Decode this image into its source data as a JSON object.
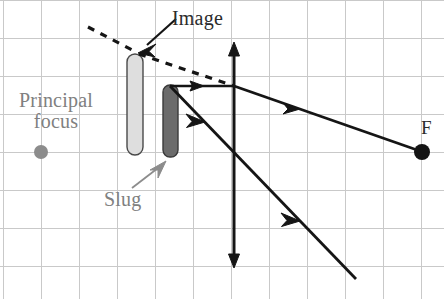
{
  "figure": {
    "type": "ray-diagram",
    "background_color": "#ffffff",
    "grid": {
      "visible": true,
      "color": "#c9c9c9",
      "spacing_px": 38,
      "x_origin_px": 41,
      "y_origin_px": 38,
      "line_width_px": 1
    }
  },
  "labels": {
    "principal_focus": "Principal\nfocus",
    "principal_focus_line1": "Principal",
    "principal_focus_line2": "focus",
    "slug": "Slug",
    "image": "Image",
    "focus_point": "F"
  },
  "colors": {
    "grid": "#c9c9c9",
    "label_gray": "#808080",
    "label_dark": "#2b2b2b",
    "ray_solid": "#1a1a1a",
    "ray_dashed": "#1a1a1a",
    "image_object_fill": "#dcdcdc",
    "image_object_stroke": "#555555",
    "slug_object_fill": "#6e6e6e",
    "slug_object_stroke": "#3d3d3d",
    "principal_focus_dot": "#8c8c8c",
    "focus_dot": "#111111"
  },
  "objects": {
    "image_bar": {
      "x": 127,
      "y": 54,
      "width": 16,
      "height": 101,
      "radius": 8
    },
    "slug_bar": {
      "x": 163,
      "y": 85,
      "width": 15,
      "height": 72,
      "radius": 7
    },
    "lens_axis": {
      "x": 234,
      "y_top": 44,
      "y_bottom": 266,
      "double_headed": true
    },
    "optical_axis_y": 152,
    "principal_focus_dot": {
      "cx": 41,
      "cy": 152,
      "r": 7
    },
    "focus_dot_F": {
      "cx": 422,
      "cy": 152,
      "r": 8
    }
  },
  "rays": {
    "dashed": [
      {
        "name": "virtual-ray-upper-left",
        "from": [
          88,
          27
        ],
        "to": [
          137,
          53
        ]
      },
      {
        "name": "virtual-ray-to-lens",
        "from": [
          137,
          53
        ],
        "to": [
          234,
          86
        ]
      }
    ],
    "solid": [
      {
        "name": "incident-parallel-ray",
        "from": [
          170,
          86
        ],
        "to": [
          234,
          86
        ],
        "arrow_at": [
          199,
          86
        ]
      },
      {
        "name": "refracted-ray-through-F",
        "from": [
          234,
          86
        ],
        "to": [
          422,
          152
        ],
        "arrow_at": [
          292,
          106
        ]
      },
      {
        "name": "ray-through-centre",
        "from": [
          170,
          86
        ],
        "to": [
          355,
          278
        ],
        "arrow_at": [
          291,
          212
        ]
      }
    ],
    "pointer_arrows": [
      {
        "name": "image-pointer",
        "from": [
          175,
          20
        ],
        "to": [
          140,
          51
        ],
        "color": "#1a1a1a"
      },
      {
        "name": "slug-pointer",
        "from": [
          130,
          190
        ],
        "to": [
          163,
          163
        ],
        "color": "#808080"
      }
    ]
  }
}
